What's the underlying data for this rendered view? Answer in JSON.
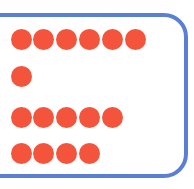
{
  "figure": {
    "canvas": {
      "width": 194,
      "height": 189,
      "background_color": "#ffffff"
    },
    "panel": {
      "name": "rounded-rectangle-outline",
      "stroke_color": "#5b7fd4",
      "stroke_width": 4,
      "corner_radius": 24,
      "left_edge_clipped": true,
      "top": 13,
      "bottom": 178,
      "right": 188
    },
    "dot_style": {
      "color": "#f4543c",
      "diameter": 21,
      "shape": "circle"
    },
    "grid": {
      "column_spacing": 22.8,
      "first_column_center_x": 21
    }
  },
  "chart_data": {
    "type": "bar",
    "orientation": "horizontal",
    "subtitle": "",
    "xlabel": "",
    "ylabel": "",
    "categories": [
      "Row 1",
      "Row 2",
      "Row 3",
      "Row 4"
    ],
    "values": [
      6,
      1,
      5,
      4
    ],
    "unit": "dots",
    "xlim": [
      0,
      6
    ],
    "grid": false,
    "legend": false,
    "marker_color": "#f4543c",
    "total_dots": 16
  },
  "rows": [
    {
      "name": "dot-row-1",
      "label": "Row 1",
      "count": 6,
      "center_y": 39,
      "dot_centers_x": [
        21,
        43,
        66,
        89,
        112,
        135
      ]
    },
    {
      "name": "dot-row-2",
      "label": "Row 2",
      "count": 1,
      "center_y": 76,
      "dot_centers_x": [
        21
      ]
    },
    {
      "name": "dot-row-3",
      "label": "Row 3",
      "count": 5,
      "center_y": 117,
      "dot_centers_x": [
        21,
        43,
        66,
        89,
        112
      ]
    },
    {
      "name": "dot-row-4",
      "label": "Row 4",
      "count": 4,
      "center_y": 153,
      "dot_centers_x": [
        21,
        43,
        66,
        89
      ]
    }
  ]
}
